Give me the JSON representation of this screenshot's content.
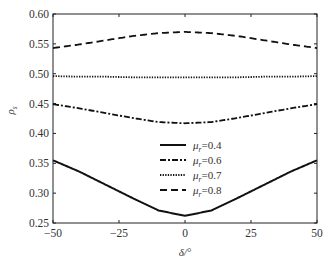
{
  "chart_data": {
    "type": "line",
    "title": "",
    "xlabel": "δ/°",
    "ylabel": "ρ_s",
    "xlim": [
      -50,
      50
    ],
    "ylim": [
      0.25,
      0.6
    ],
    "xticks": [
      "-50",
      "-25",
      "0",
      "25",
      "50"
    ],
    "yticks": [
      "0.25",
      "0.30",
      "0.35",
      "0.40",
      "0.45",
      "0.50",
      "0.55",
      "0.60"
    ],
    "grid": false,
    "legend_position": "lower center",
    "x": [
      -50,
      -40,
      -30,
      -20,
      -10,
      0,
      10,
      20,
      30,
      40,
      50
    ],
    "series": [
      {
        "name": "μr=0.4",
        "style": "solid",
        "values": [
          0.355,
          0.336,
          0.314,
          0.292,
          0.271,
          0.262,
          0.271,
          0.292,
          0.314,
          0.336,
          0.355
        ]
      },
      {
        "name": "μr=0.6",
        "style": "dashdot",
        "values": [
          0.449,
          0.442,
          0.434,
          0.426,
          0.419,
          0.417,
          0.419,
          0.426,
          0.434,
          0.442,
          0.449
        ]
      },
      {
        "name": "μr=0.7",
        "style": "dotted",
        "values": [
          0.496,
          0.495,
          0.495,
          0.494,
          0.494,
          0.494,
          0.494,
          0.494,
          0.495,
          0.495,
          0.496
        ]
      },
      {
        "name": "μr=0.8",
        "style": "dashed",
        "values": [
          0.543,
          0.549,
          0.556,
          0.563,
          0.568,
          0.57,
          0.568,
          0.563,
          0.556,
          0.549,
          0.543
        ]
      }
    ]
  },
  "legend": [
    {
      "label_sym": "μ",
      "label_sub": "r",
      "label_val": "=0.4"
    },
    {
      "label_sym": "μ",
      "label_sub": "r",
      "label_val": "=0.6"
    },
    {
      "label_sym": "μ",
      "label_sub": "r",
      "label_val": "=0.7"
    },
    {
      "label_sym": "μ",
      "label_sub": "r",
      "label_val": "=0.8"
    }
  ],
  "axes": {
    "xlabel_sym": "δ",
    "xlabel_unit": "/°",
    "ylabel_sym": "ρ",
    "ylabel_sub": "s"
  }
}
